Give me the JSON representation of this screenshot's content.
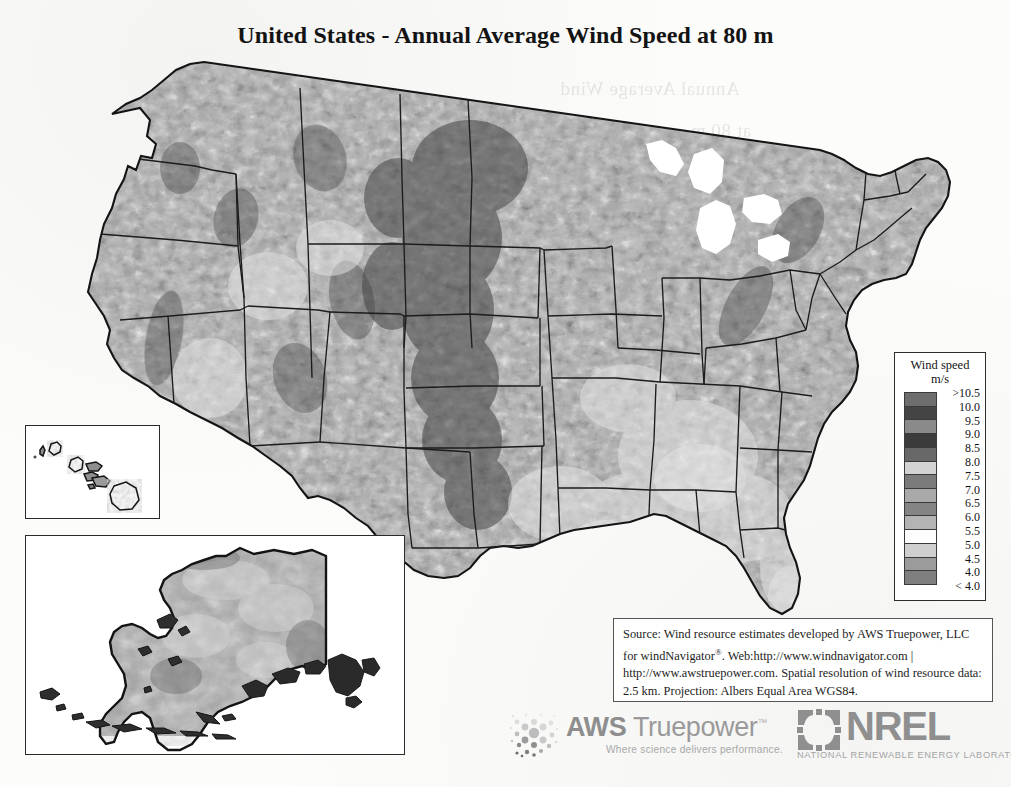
{
  "title": "United States - Annual Average Wind Speed at 80 m",
  "map": {
    "region_label": "contiguous-united-states",
    "insets": [
      {
        "name": "hawaii",
        "label": "Hawaii"
      },
      {
        "name": "alaska",
        "label": "Alaska"
      }
    ]
  },
  "legend": {
    "title_line1": "Wind speed",
    "title_line2": "m/s",
    "labels": [
      ">10.5",
      "10.0",
      "9.5",
      "9.0",
      "8.5",
      "8.0",
      "7.5",
      "7.0",
      "6.5",
      "6.0",
      "5.5",
      "5.0",
      "4.5",
      "4.0",
      "< 4.0"
    ],
    "swatch_colors": [
      "#6d6d6d",
      "#444444",
      "#8a8a8a",
      "#3c3c3c",
      "#686868",
      "#d3d3d3",
      "#7b7b7b",
      "#a9a9a9",
      "#848484",
      "#b4b4b4",
      "#fdfdfd",
      "#cfcfcf",
      "#9b9b9b",
      "#7f7f7f"
    ]
  },
  "source": {
    "line1": "Source: Wind resource estimates developed by AWS Truepower,",
    "line2a": "LLC for windNavigator",
    "line2_reg": "®",
    "line2b": ". Web:http://www.windnavigator.com |",
    "line3": "http://www.awstruepower.com. Spatial resolution of wind resource",
    "line4": "data: 2.5 km. Projection: Albers Equal Area WGS84."
  },
  "logos": {
    "aws": {
      "word_bold": "AWS",
      "word_light": " Truepower",
      "trademark": "™",
      "tagline": "Where science delivers performance."
    },
    "nrel": {
      "word": "NREL",
      "subtitle": "NATIONAL RENEWABLE ENERGY LABORATORY"
    }
  },
  "bleed_through": [
    {
      "text": "Annual Average Wind",
      "x": 560,
      "y": 78
    },
    {
      "text": "at 80 m",
      "x": 690,
      "y": 120
    },
    {
      "text": "wind resource map",
      "x": 120,
      "y": 600
    },
    {
      "text": "of the 80 m",
      "x": 200,
      "y": 630
    }
  ],
  "chart_data": {
    "type": "heatmap",
    "title": "United States - Annual Average Wind Speed at 80 m",
    "units": "m/s",
    "legend_position": "right",
    "colorbar_levels": [
      4.0,
      4.5,
      5.0,
      5.5,
      6.0,
      6.5,
      7.0,
      7.5,
      8.0,
      8.5,
      9.0,
      9.5,
      10.0,
      10.5
    ],
    "colorbar_min_label": "< 4.0",
    "colorbar_max_label": ">10.5",
    "projection": "Albers Equal Area WGS84",
    "spatial_resolution_km": 2.5,
    "regional_estimates": [
      {
        "region": "Great Plains (TX panhandle to ND)",
        "typical_value": 8.5
      },
      {
        "region": "Rocky Mountain ridges",
        "typical_value": 9.0
      },
      {
        "region": "Pacific Northwest coast",
        "typical_value": 7.5
      },
      {
        "region": "Southeast interior",
        "typical_value": 4.5
      },
      {
        "region": "Gulf Coast",
        "typical_value": 5.5
      },
      {
        "region": "Northeast / Appalachian ridges",
        "typical_value": 7.0
      },
      {
        "region": "Alaska North Slope",
        "typical_value": 7.0
      },
      {
        "region": "Alaska Aleutian chain",
        "typical_value": 9.5
      },
      {
        "region": "Hawaii ridges",
        "typical_value": 8.0
      },
      {
        "region": "Desert Southwest",
        "typical_value": 5.0
      }
    ]
  }
}
